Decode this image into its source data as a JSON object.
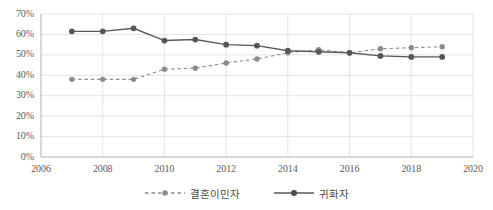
{
  "chart_data": {
    "type": "line",
    "title": "",
    "subtitle": "",
    "xlabel": "",
    "ylabel": "",
    "x": [
      2007,
      2008,
      2009,
      2010,
      2011,
      2012,
      2013,
      2014,
      2015,
      2016,
      2017,
      2018,
      2019
    ],
    "xlim": [
      2006,
      2020
    ],
    "ylim": [
      0,
      70
    ],
    "grid": true,
    "legend_position": "bottom",
    "xtick_labels": [
      "2006",
      "2008",
      "2010",
      "2012",
      "2014",
      "2016",
      "2018",
      "2020"
    ],
    "xticks": [
      2006,
      2008,
      2010,
      2012,
      2014,
      2016,
      2018,
      2020
    ],
    "ytick_labels": [
      "0%",
      "10%",
      "20%",
      "30%",
      "40%",
      "50%",
      "60%",
      "70%"
    ],
    "yticks": [
      0,
      10,
      20,
      30,
      40,
      50,
      60,
      70
    ],
    "series": [
      {
        "name": "결혼이민자",
        "style": "dashed",
        "color": "#8c8c8c",
        "marker": "circle",
        "values": [
          38,
          38,
          38,
          43,
          43.5,
          46,
          48,
          51,
          52.5,
          51,
          53,
          53.5,
          54
        ]
      },
      {
        "name": "귀화자",
        "style": "solid",
        "color": "#595959",
        "marker": "circle",
        "values": [
          61.5,
          61.5,
          63,
          57,
          57.5,
          55,
          54.5,
          52,
          51.5,
          51,
          49.5,
          49,
          49
        ]
      }
    ]
  },
  "legend": {
    "entries": [
      {
        "label": "결혼이민자"
      },
      {
        "label": "귀화자"
      }
    ]
  },
  "colors": {
    "series_dashed": "#8c8c8c",
    "series_solid": "#595959",
    "gridline": "#dcdcdc",
    "axis": "#b0b0b0",
    "tick_text": "#5b5b5b"
  }
}
